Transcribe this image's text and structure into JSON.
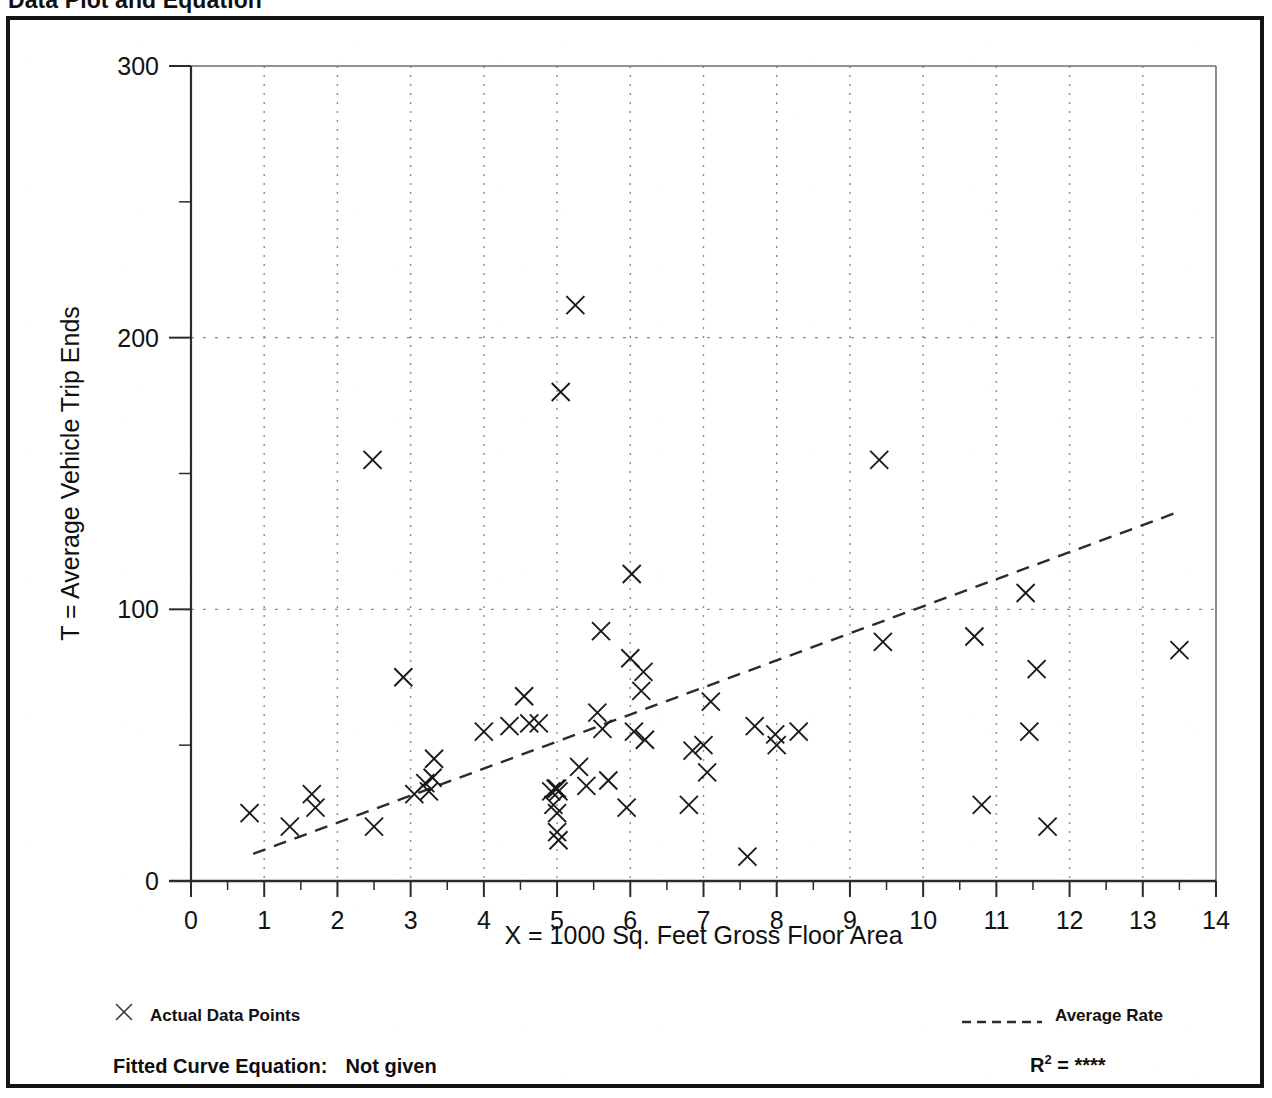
{
  "page": {
    "title": "Data Plot and Equation"
  },
  "legend": {
    "marker_label": "Actual Data Points",
    "marker_icon": "x-marker-icon",
    "line_label": "Average Rate",
    "line_icon": "dashed-line-icon"
  },
  "footer": {
    "equation_label": "Fitted Curve Equation:",
    "equation_value": "Not given",
    "rsq_symbol": "R",
    "rsq_exponent": "2",
    "rsq_equals": "=",
    "rsq_value": "****"
  },
  "colors": {
    "frame": "#141414",
    "axis": "#2b2b2b",
    "gridline": "#8c8c8c",
    "marker": "#1a1a1a",
    "trendline": "#2b2b2b",
    "text": "#101010",
    "background": "#ffffff"
  },
  "chart_data": {
    "type": "scatter",
    "title": "Data Plot and Equation",
    "xlabel": "X = 1000 Sq. Feet Gross Floor Area",
    "ylabel": "T = Average Vehicle Trip Ends",
    "xlim": [
      0,
      14
    ],
    "ylim": [
      0,
      300
    ],
    "xticks": [
      0,
      1,
      2,
      3,
      4,
      5,
      6,
      7,
      8,
      9,
      10,
      11,
      12,
      13,
      14
    ],
    "xtick_labels": [
      "0",
      "1",
      "2",
      "3",
      "4",
      "5",
      "6",
      "7",
      "8",
      "9",
      "10",
      "11",
      "12",
      "13",
      "14"
    ],
    "xminor_step": 0.5,
    "yticks": [
      0,
      100,
      200,
      300
    ],
    "ytick_labels": [
      "0",
      "100",
      "200",
      "300"
    ],
    "yminor_step": 50,
    "grid": true,
    "grid_style": "dotted",
    "grid_x_values": [
      1,
      2,
      3,
      4,
      5,
      6,
      7,
      8,
      9,
      10,
      11,
      12,
      13
    ],
    "grid_y_values": [
      100,
      200
    ],
    "legend_position": "below-axes",
    "series": [
      {
        "name": "Actual Data Points",
        "marker": "x",
        "points": [
          [
            0.8,
            25
          ],
          [
            1.35,
            20
          ],
          [
            1.65,
            32
          ],
          [
            1.7,
            27
          ],
          [
            2.48,
            155
          ],
          [
            2.5,
            20
          ],
          [
            2.9,
            75
          ],
          [
            3.05,
            32
          ],
          [
            3.2,
            36
          ],
          [
            3.25,
            33
          ],
          [
            3.3,
            38
          ],
          [
            3.32,
            45
          ],
          [
            4.0,
            55
          ],
          [
            4.35,
            57
          ],
          [
            4.55,
            68
          ],
          [
            4.62,
            58
          ],
          [
            4.75,
            58
          ],
          [
            4.92,
            33
          ],
          [
            4.95,
            28
          ],
          [
            4.98,
            34
          ],
          [
            5.0,
            34
          ],
          [
            5.02,
            33
          ],
          [
            5.0,
            25
          ],
          [
            5.0,
            18
          ],
          [
            5.02,
            15
          ],
          [
            5.05,
            180
          ],
          [
            5.25,
            212
          ],
          [
            5.3,
            42
          ],
          [
            5.4,
            35
          ],
          [
            5.55,
            62
          ],
          [
            5.6,
            92
          ],
          [
            5.62,
            56
          ],
          [
            5.7,
            37
          ],
          [
            5.95,
            27
          ],
          [
            6.0,
            82
          ],
          [
            6.02,
            113
          ],
          [
            6.05,
            55
          ],
          [
            6.15,
            70
          ],
          [
            6.18,
            77
          ],
          [
            6.2,
            52
          ],
          [
            6.8,
            28
          ],
          [
            6.85,
            48
          ],
          [
            7.0,
            50
          ],
          [
            7.05,
            40
          ],
          [
            7.1,
            66
          ],
          [
            7.6,
            9
          ],
          [
            7.7,
            57
          ],
          [
            7.98,
            54
          ],
          [
            8.0,
            50
          ],
          [
            8.3,
            55
          ],
          [
            9.4,
            155
          ],
          [
            9.45,
            88
          ],
          [
            10.7,
            90
          ],
          [
            10.8,
            28
          ],
          [
            11.4,
            106
          ],
          [
            11.45,
            55
          ],
          [
            11.55,
            78
          ],
          [
            11.7,
            20
          ],
          [
            13.5,
            85
          ]
        ]
      }
    ],
    "trendline": {
      "name": "Average Rate",
      "style": "dashed",
      "x_start": 0.85,
      "y_start": 10,
      "x_end": 13.5,
      "y_end": 136
    }
  }
}
